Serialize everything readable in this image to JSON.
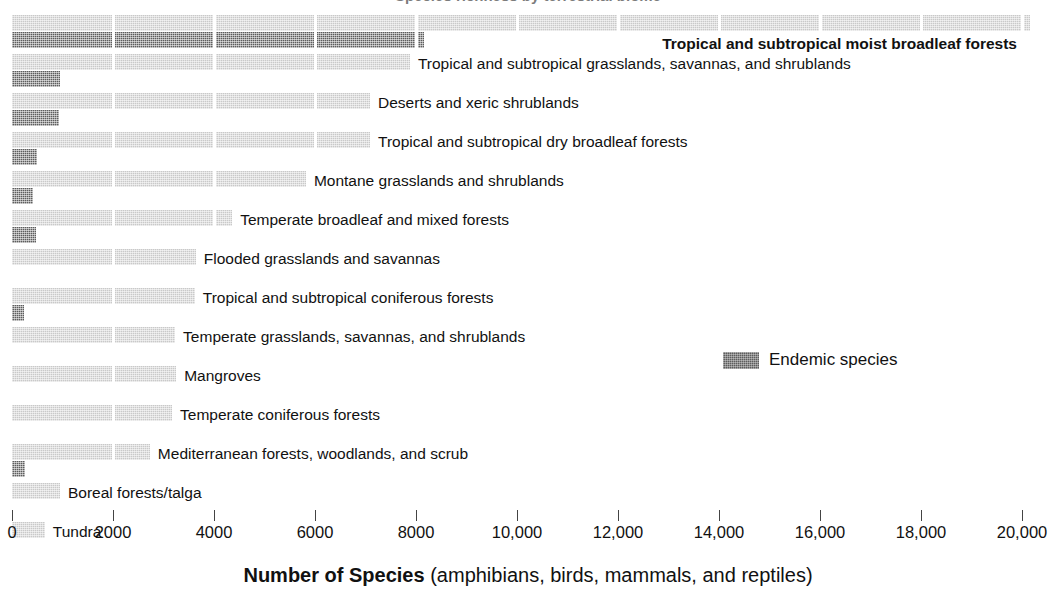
{
  "title_sliver": {
    "text": "Species richness by terrestrial biome"
  },
  "legend": {
    "position": "inside-right",
    "entries": [
      {
        "label": "Endemic species",
        "color": "#5d5d5d",
        "name": "endemic-species"
      }
    ],
    "endemic_label": "Endemic species"
  },
  "axis": {
    "title_strong": "Number of Species",
    "title_normal": " (amphibians, birds, mammals, and reptiles)",
    "tick_labels": [
      "0",
      "2000",
      "4000",
      "6000",
      "8000",
      "10,000",
      "12,000",
      "14,000",
      "16,000",
      "18,000",
      "20,000"
    ]
  },
  "colors": {
    "total_species": "#c9c9c9",
    "endemic_species": "#5d5d5d",
    "text": "#111111",
    "background": "#ffffff"
  },
  "chart_data": {
    "type": "bar",
    "orientation": "horizontal",
    "title": "Species richness by terrestrial biome",
    "xlabel": "Number of Species (amphibians, birds, mammals, and reptiles)",
    "ylabel": "",
    "xlim": [
      0,
      20000
    ],
    "xticks": [
      0,
      2000,
      4000,
      6000,
      8000,
      10000,
      12000,
      14000,
      16000,
      18000,
      20000
    ],
    "xtick_labels": [
      "0",
      "2000",
      "4000",
      "6000",
      "8000",
      "10,000",
      "12,000",
      "14,000",
      "16,000",
      "18,000",
      "20,000"
    ],
    "grid": false,
    "legend_position": "inside-right",
    "categories": [
      "Tropical and subtropical moist broadleaf forests",
      "Tropical and subtropical grasslands, savannas, and shrublands",
      "Deserts and xeric shrublands",
      "Tropical and subtropical dry broadleaf forests",
      "Montane grasslands and shrublands",
      "Temperate broadleaf and mixed forests",
      "Flooded grasslands and savannas",
      "Tropical and subtropical coniferous forests",
      "Temperate grasslands, savannas, and shrublands",
      "Mangroves",
      "Temperate coniferous forests",
      "Mediterranean forests, woodlands, and scrub",
      "Boreal forests/talga",
      "Tundra"
    ],
    "series": [
      {
        "name": "Total species",
        "color": "#c9c9c9",
        "values": [
          20150,
          7880,
          7090,
          7090,
          5820,
          4360,
          3640,
          3620,
          3230,
          3250,
          3170,
          2730,
          950,
          650
        ]
      },
      {
        "name": "Endemic species",
        "color": "#5d5d5d",
        "values": [
          8160,
          950,
          930,
          495,
          415,
          475,
          0,
          240,
          0,
          0,
          0,
          260,
          0,
          0
        ]
      }
    ]
  },
  "rows": [
    {
      "label": "Tropical and subtropical moist broadleaf forests",
      "bold": true,
      "total": 20150,
      "endemic": 8160,
      "label_align": "right"
    },
    {
      "label": "Tropical and subtropical grasslands, savannas, and shrublands",
      "bold": false,
      "total": 7880,
      "endemic": 950,
      "label_align": "left"
    },
    {
      "label": "Deserts and xeric shrublands",
      "bold": false,
      "total": 7090,
      "endemic": 930,
      "label_align": "left"
    },
    {
      "label": "Tropical and subtropical dry broadleaf forests",
      "bold": false,
      "total": 7090,
      "endemic": 495,
      "label_align": "left"
    },
    {
      "label": "Montane grasslands and shrublands",
      "bold": false,
      "total": 5820,
      "endemic": 415,
      "label_align": "left"
    },
    {
      "label": "Temperate broadleaf and mixed forests",
      "bold": false,
      "total": 4360,
      "endemic": 475,
      "label_align": "left"
    },
    {
      "label": "Flooded grasslands and savannas",
      "bold": false,
      "total": 3640,
      "endemic": 0,
      "label_align": "left"
    },
    {
      "label": "Tropical and subtropical coniferous forests",
      "bold": false,
      "total": 3620,
      "endemic": 240,
      "label_align": "left"
    },
    {
      "label": "Temperate grasslands, savannas, and shrublands",
      "bold": false,
      "total": 3230,
      "endemic": 0,
      "label_align": "left"
    },
    {
      "label": "Mangroves",
      "bold": false,
      "total": 3250,
      "endemic": 0,
      "label_align": "left"
    },
    {
      "label": "Temperate coniferous forests",
      "bold": false,
      "total": 3170,
      "endemic": 0,
      "label_align": "left"
    },
    {
      "label": "Mediterranean forests, woodlands, and scrub",
      "bold": false,
      "total": 2730,
      "endemic": 260,
      "label_align": "left"
    },
    {
      "label": "Boreal forests/talga",
      "bold": false,
      "total": 950,
      "endemic": 0,
      "label_align": "left"
    },
    {
      "label": "Tundra",
      "bold": false,
      "total": 650,
      "endemic": 0,
      "label_align": "left"
    }
  ]
}
